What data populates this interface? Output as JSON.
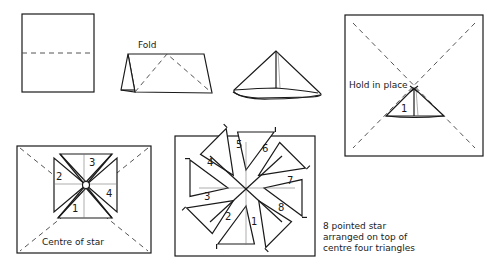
{
  "labels": {
    "fold": "Fold",
    "hold_in_place": "Hold in place",
    "centre_of_star": "Centre of star",
    "caption_lines": [
      "8 pointed star",
      "arranged on top of",
      "centre four triangles"
    ]
  },
  "step5": {
    "numbers": [
      "1"
    ]
  },
  "step6": {
    "numbers": [
      "1",
      "2",
      "3",
      "4"
    ]
  },
  "step7": {
    "numbers": [
      "1",
      "2",
      "3",
      "4",
      "5",
      "6",
      "7",
      "8"
    ]
  }
}
